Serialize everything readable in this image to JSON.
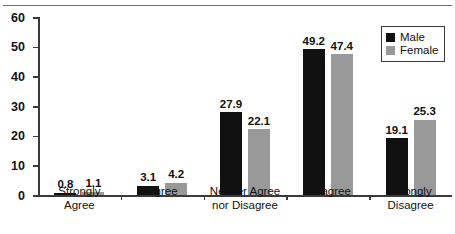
{
  "chart_data": {
    "type": "bar",
    "title": "",
    "subtitle": "",
    "xlabel": "",
    "ylabel": "",
    "ylim": [
      0,
      60
    ],
    "yticks": [
      0,
      10,
      20,
      30,
      40,
      50,
      60
    ],
    "grid": false,
    "legend_position": "top-right",
    "categories": [
      "Strongly\nAgree",
      "Agree",
      "Neither Agree\nnor Disagree",
      "Disagree",
      "Strongly\nDisagree"
    ],
    "series": [
      {
        "name": "Male",
        "color": "#111111",
        "values": [
          0.8,
          3.1,
          27.9,
          49.2,
          19.1
        ],
        "labels": [
          "0.8",
          "3.1",
          "27.9",
          "49.2",
          "19.1"
        ]
      },
      {
        "name": "Female",
        "color": "#999999",
        "values": [
          1.1,
          4.2,
          22.1,
          47.4,
          25.3
        ],
        "labels": [
          "1.1",
          "4.2",
          "22.1",
          "47.4",
          "25.3"
        ]
      }
    ]
  },
  "axis": {
    "y_tick_labels": [
      "0",
      "10",
      "20",
      "30",
      "40",
      "50",
      "60"
    ]
  },
  "legend": {
    "items": [
      {
        "label": "Male",
        "color": "#111111"
      },
      {
        "label": "Female",
        "color": "#999999"
      }
    ]
  }
}
